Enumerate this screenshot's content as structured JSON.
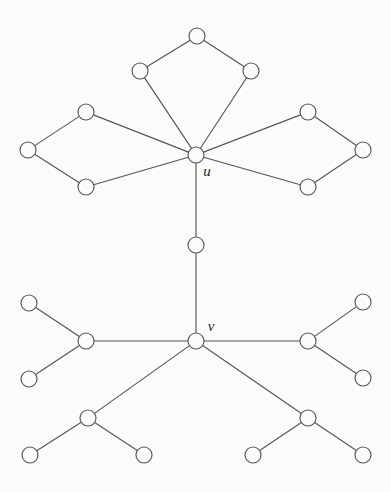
{
  "figure": {
    "width": 391,
    "height": 492,
    "background_color": "#fbfbfa",
    "stroke_color": "#55565a",
    "vertex_fill_color": "#fbfbfa",
    "label_color": "#1d1d20",
    "vertex_radius": 8,
    "stroke_width": 1.15,
    "total_vertices": 24,
    "total_edges": 25
  },
  "labels": [
    {
      "id": "label-u",
      "text": "u",
      "x": 207,
      "y": 176,
      "anchor_vertex": "u"
    },
    {
      "id": "label-v",
      "text": "v",
      "x": 211,
      "y": 331,
      "anchor_vertex": "v"
    }
  ],
  "vertices": [
    {
      "id": "u",
      "name": "vertex-u",
      "x": 196,
      "y": 155,
      "label": "u",
      "degree": 7
    },
    {
      "id": "v",
      "name": "vertex-v",
      "x": 196,
      "y": 341,
      "label": "v",
      "degree": 5
    },
    {
      "id": "m1",
      "name": "vertex-middle-path",
      "x": 196,
      "y": 245,
      "label": "",
      "degree": 2
    },
    {
      "id": "t_apex",
      "name": "vertex-top-diamond-apex",
      "x": 197,
      "y": 36,
      "label": "",
      "degree": 2
    },
    {
      "id": "t_left",
      "name": "vertex-top-diamond-left",
      "x": 140,
      "y": 71,
      "label": "",
      "degree": 2
    },
    {
      "id": "t_right",
      "name": "vertex-top-diamond-right",
      "x": 251,
      "y": 71,
      "label": "",
      "degree": 2
    },
    {
      "id": "l_top",
      "name": "vertex-left-diamond-top",
      "x": 86,
      "y": 112,
      "label": "",
      "degree": 2
    },
    {
      "id": "l_far",
      "name": "vertex-left-diamond-outer",
      "x": 28,
      "y": 150,
      "label": "",
      "degree": 2
    },
    {
      "id": "l_bot",
      "name": "vertex-left-diamond-bottom",
      "x": 86,
      "y": 187,
      "label": "",
      "degree": 2
    },
    {
      "id": "r_top",
      "name": "vertex-right-diamond-top",
      "x": 308,
      "y": 112,
      "label": "",
      "degree": 2
    },
    {
      "id": "r_far",
      "name": "vertex-right-diamond-outer",
      "x": 363,
      "y": 150,
      "label": "",
      "degree": 2
    },
    {
      "id": "r_bot",
      "name": "vertex-right-diamond-bottom",
      "x": 308,
      "y": 187,
      "label": "",
      "degree": 2
    },
    {
      "id": "wl_hub",
      "name": "vertex-left-claw-hub",
      "x": 86,
      "y": 341,
      "label": "",
      "degree": 3
    },
    {
      "id": "wl_a",
      "name": "vertex-left-claw-leaf-top",
      "x": 29,
      "y": 303,
      "label": "",
      "degree": 1
    },
    {
      "id": "wl_b",
      "name": "vertex-left-claw-leaf-bottom",
      "x": 29,
      "y": 379,
      "label": "",
      "degree": 1
    },
    {
      "id": "wr_hub",
      "name": "vertex-right-claw-hub",
      "x": 308,
      "y": 341,
      "label": "",
      "degree": 3
    },
    {
      "id": "wr_a",
      "name": "vertex-right-claw-leaf-top",
      "x": 363,
      "y": 302,
      "label": "",
      "degree": 1
    },
    {
      "id": "wr_b",
      "name": "vertex-right-claw-leaf-bottom",
      "x": 363,
      "y": 378,
      "label": "",
      "degree": 1
    },
    {
      "id": "bl_hub",
      "name": "vertex-lower-left-claw-hub",
      "x": 88,
      "y": 418,
      "label": "",
      "degree": 3
    },
    {
      "id": "bl_a",
      "name": "vertex-lower-left-claw-leaf-left",
      "x": 30,
      "y": 455,
      "label": "",
      "degree": 1
    },
    {
      "id": "bl_b",
      "name": "vertex-lower-left-claw-leaf-right",
      "x": 144,
      "y": 455,
      "label": "",
      "degree": 1
    },
    {
      "id": "br_hub",
      "name": "vertex-lower-right-claw-hub",
      "x": 308,
      "y": 418,
      "label": "",
      "degree": 3
    },
    {
      "id": "br_a",
      "name": "vertex-lower-right-claw-leaf-left",
      "x": 253,
      "y": 455,
      "label": "",
      "degree": 1
    },
    {
      "id": "br_b",
      "name": "vertex-lower-right-claw-leaf-right",
      "x": 363,
      "y": 455,
      "label": "",
      "degree": 1
    }
  ],
  "edges": [
    {
      "id": "e1",
      "name": "edge-top-apex-to-left",
      "from": "t_apex",
      "to": "t_left"
    },
    {
      "id": "e2",
      "name": "edge-top-apex-to-right",
      "from": "t_apex",
      "to": "t_right"
    },
    {
      "id": "e3",
      "name": "edge-top-left-to-u",
      "from": "t_left",
      "to": "u"
    },
    {
      "id": "e4",
      "name": "edge-top-right-to-u",
      "from": "t_right",
      "to": "u"
    },
    {
      "id": "e5",
      "name": "edge-left-top-to-outer",
      "from": "l_top",
      "to": "l_far"
    },
    {
      "id": "e6",
      "name": "edge-left-outer-to-bottom",
      "from": "l_far",
      "to": "l_bot"
    },
    {
      "id": "e7",
      "name": "edge-left-top-to-u",
      "from": "l_top",
      "to": "u"
    },
    {
      "id": "e8",
      "name": "edge-left-bottom-to-u",
      "from": "l_bot",
      "to": "u"
    },
    {
      "id": "e9",
      "name": "edge-right-top-to-outer",
      "from": "r_top",
      "to": "r_far"
    },
    {
      "id": "e10",
      "name": "edge-right-outer-to-bottom",
      "from": "r_far",
      "to": "r_bot"
    },
    {
      "id": "e11",
      "name": "edge-right-top-to-u",
      "from": "r_top",
      "to": "u"
    },
    {
      "id": "e12",
      "name": "edge-right-bottom-to-u",
      "from": "r_bot",
      "to": "u"
    },
    {
      "id": "e13",
      "name": "edge-u-to-middle",
      "from": "u",
      "to": "m1"
    },
    {
      "id": "e14",
      "name": "edge-middle-to-v",
      "from": "m1",
      "to": "v"
    },
    {
      "id": "e15",
      "name": "edge-v-to-left-claw-hub",
      "from": "v",
      "to": "wl_hub"
    },
    {
      "id": "e16",
      "name": "edge-left-claw-hub-to-leaf-top",
      "from": "wl_hub",
      "to": "wl_a"
    },
    {
      "id": "e17",
      "name": "edge-left-claw-hub-to-leaf-bottom",
      "from": "wl_hub",
      "to": "wl_b"
    },
    {
      "id": "e18",
      "name": "edge-v-to-right-claw-hub",
      "from": "v",
      "to": "wr_hub"
    },
    {
      "id": "e19",
      "name": "edge-right-claw-hub-to-leaf-top",
      "from": "wr_hub",
      "to": "wr_a"
    },
    {
      "id": "e20",
      "name": "edge-right-claw-hub-to-leaf-bottom",
      "from": "wr_hub",
      "to": "wr_b"
    },
    {
      "id": "e21",
      "name": "edge-v-to-lower-left-claw-hub",
      "from": "v",
      "to": "bl_hub"
    },
    {
      "id": "e22",
      "name": "edge-lower-left-claw-hub-to-leaf-left",
      "from": "bl_hub",
      "to": "bl_a"
    },
    {
      "id": "e23",
      "name": "edge-lower-left-claw-hub-to-leaf-right",
      "from": "bl_hub",
      "to": "bl_b"
    },
    {
      "id": "e24",
      "name": "edge-v-to-lower-right-claw-hub",
      "from": "v",
      "to": "br_hub"
    },
    {
      "id": "e25",
      "name": "edge-lower-right-claw-hub-to-leaf-left",
      "from": "br_hub",
      "to": "br_a"
    },
    {
      "id": "e26",
      "name": "edge-lower-right-claw-hub-to-leaf-right",
      "from": "br_hub",
      "to": "br_b"
    }
  ]
}
